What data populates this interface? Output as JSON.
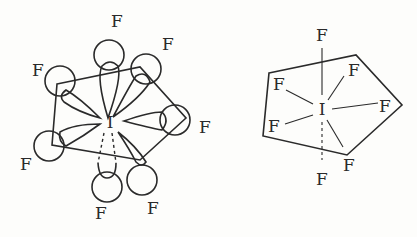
{
  "diagram": {
    "left": {
      "central_atom": "I",
      "ligand_labels": [
        "F",
        "F",
        "F",
        "F",
        "F",
        "F",
        "F"
      ],
      "description": "orbital lobe representation"
    },
    "right": {
      "central_atom": "I",
      "ligand_labels": [
        "F",
        "F",
        "F",
        "F",
        "F",
        "F",
        "F"
      ],
      "description": "bond line representation"
    }
  }
}
